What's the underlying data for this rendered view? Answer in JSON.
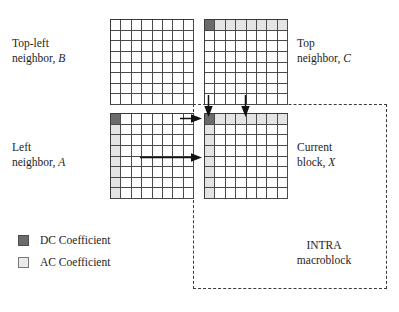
{
  "figure": {
    "type": "diagram"
  },
  "labels": {
    "top_left_neighbor": {
      "line1": "Top-left",
      "line2_prefix": "neighbor, ",
      "line2_symbol": "B"
    },
    "top_neighbor": {
      "line1": "Top",
      "line2_prefix": "neighbor, ",
      "line2_symbol": "C"
    },
    "left_neighbor": {
      "line1": "Left",
      "line2_prefix": "neighbor, ",
      "line2_symbol": "A"
    },
    "current_block": {
      "line1": "Current",
      "line2_prefix": "block, ",
      "line2_symbol": "X"
    },
    "macroblock": {
      "line1": "INTRA",
      "line2": "macroblock"
    }
  },
  "legend": {
    "items": [
      {
        "label": "DC Coefficient",
        "swatch": "dc",
        "color": "#6b6b6b"
      },
      {
        "label": "AC Coefficient",
        "swatch": "ac",
        "color": "#eaeaea"
      }
    ]
  },
  "blocks": [
    {
      "id": "B",
      "name": "top-left-neighbor-block",
      "rows": 8,
      "cols": 8,
      "dc_cell": null,
      "ac_top_row": false,
      "ac_left_col": false
    },
    {
      "id": "C",
      "name": "top-neighbor-block",
      "rows": 8,
      "cols": 8,
      "dc_cell": [
        0,
        0
      ],
      "ac_top_row": true,
      "ac_left_col": false
    },
    {
      "id": "A",
      "name": "left-neighbor-block",
      "rows": 8,
      "cols": 8,
      "dc_cell": [
        0,
        0
      ],
      "ac_top_row": false,
      "ac_left_col": true
    },
    {
      "id": "X",
      "name": "current-block",
      "rows": 8,
      "cols": 8,
      "dc_cell": [
        0,
        0
      ],
      "ac_top_row": true,
      "ac_left_col": true
    }
  ],
  "arrows": [
    {
      "name": "arrow-c-to-x-dc",
      "direction": "down",
      "from": "C",
      "to": "X"
    },
    {
      "name": "arrow-c-to-x-ac",
      "direction": "down",
      "from": "C",
      "to": "X"
    },
    {
      "name": "arrow-a-to-x-dc",
      "direction": "right",
      "from": "A",
      "to": "X"
    },
    {
      "name": "arrow-a-to-x-ac",
      "direction": "right",
      "from": "A",
      "to": "X"
    }
  ],
  "colors": {
    "dc_coefficient": "#6b6b6b",
    "ac_coefficient": "#e4e4e4",
    "grid_line": "#4a4a4a",
    "dashed_border": "#3a3a3a",
    "text": "#1d1d1d",
    "background": "#ffffff"
  }
}
